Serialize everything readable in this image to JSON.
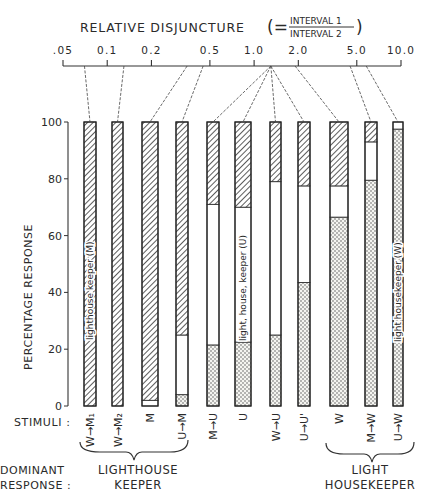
{
  "chart_data": {
    "type": "bar",
    "subtype": "stacked-100-percent",
    "title": "RELATIVE DISJUNCTURE",
    "title_formula": {
      "prefix": "(=",
      "numerator": "INTERVAL 1",
      "denominator": "INTERVAL 2",
      "suffix": ")"
    },
    "top_axis": {
      "label": "RELATIVE DISJUNCTURE",
      "scale": "log",
      "ticks": [
        ".05",
        "0.1",
        "0.2",
        "0.5",
        "1.0",
        "2.0",
        "5.0",
        "10.0"
      ],
      "tick_values": [
        0.05,
        0.1,
        0.2,
        0.5,
        1.0,
        2.0,
        5.0,
        10.0
      ],
      "bar_disjuncture_values": [
        0.07,
        0.13,
        0.35,
        0.45,
        1.3,
        1.3,
        1.3,
        1.3,
        1.9,
        4.5,
        5.8
      ]
    },
    "ylabel": "PERCENTAGE RESPONSE",
    "ylim": [
      0,
      100
    ],
    "yticks": [
      "0",
      "20",
      "40",
      "60",
      "80",
      "100"
    ],
    "xlabel": "STIMULI :",
    "categories": [
      "W→M₁",
      "W→M₂",
      "M",
      "U→M",
      "M→U",
      "U",
      "W→U",
      "U→U'",
      "W",
      "M→W",
      "U→W"
    ],
    "series": [
      {
        "name": "light housekeeper (W)",
        "pattern": "dotted",
        "values": [
          0,
          0,
          0,
          4,
          21.5,
          22.5,
          25,
          43.5,
          66.5,
          79.5,
          97.5
        ]
      },
      {
        "name": "light, house, keeper (U)",
        "pattern": "white",
        "values": [
          0,
          0,
          2,
          21,
          49.5,
          47.5,
          54,
          34,
          11,
          13.5,
          2.5
        ]
      },
      {
        "name": "lighthouse keeper (M)",
        "pattern": "hatched",
        "values": [
          100,
          100,
          98,
          75,
          29,
          30,
          21,
          22.5,
          22.5,
          7,
          0
        ]
      }
    ],
    "annotations": [
      {
        "text": "lighthouse keeper (M)",
        "bar": "W→M₁"
      },
      {
        "text": "light, house, keeper (U)",
        "bar": "U"
      },
      {
        "text": "light housekeeper (W)",
        "bar": "U→W"
      }
    ],
    "dominant_response": {
      "label": "DOMINANT RESPONSE :",
      "groups": [
        {
          "label_line1": "LIGHTHOUSE",
          "label_line2": "KEEPER",
          "bars": [
            "W→M₁",
            "W→M₂",
            "M",
            "U→M"
          ]
        },
        {
          "label_line1": "LIGHT",
          "label_line2": "HOUSEKEEPER",
          "bars": [
            "W",
            "M→W",
            "U→W"
          ]
        }
      ]
    },
    "grid": false,
    "legend_position": "inline-in-bars"
  },
  "labels": {
    "title": "RELATIVE DISJUNCTURE",
    "formula_open": "(=",
    "formula_num": "INTERVAL 1",
    "formula_den": "INTERVAL 2",
    "formula_close": ")",
    "ylabel": "PERCENTAGE RESPONSE",
    "stimuli": "STIMULI :",
    "dominant_1": "DOMINANT",
    "dominant_2": "RESPONSE :",
    "group1_l1": "LIGHTHOUSE",
    "group1_l2": "KEEPER",
    "group2_l1": "LIGHT",
    "group2_l2": "HOUSEKEEPER",
    "ann_m": "lighthouse keeper (M)",
    "ann_u": "light, house, keeper (U)",
    "ann_w": "light housekeeper (W)"
  }
}
